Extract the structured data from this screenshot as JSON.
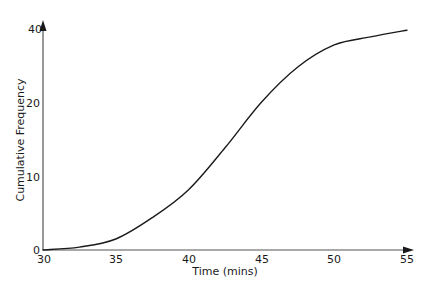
{
  "chart_data": {
    "type": "line",
    "title": "",
    "xlabel": "Time (mins)",
    "ylabel": "Cumulative Frequency",
    "x_ticks": [
      "30",
      "35",
      "40",
      "45",
      "50",
      "55"
    ],
    "y_ticks": [
      "0",
      "10",
      "20",
      "40"
    ],
    "xlim": [
      30,
      55
    ],
    "ylim": [
      0,
      40
    ],
    "grid": false,
    "legend": null,
    "series": [
      {
        "name": "Cumulative Frequency",
        "x": [
          30,
          32.5,
          35,
          37.5,
          40,
          42.5,
          45,
          47.5,
          50,
          52.5,
          55
        ],
        "values": [
          0,
          0.4,
          1.5,
          4.4,
          8.2,
          13.9,
          20.1,
          24.9,
          27.9,
          29.0,
          29.9
        ]
      }
    ]
  },
  "colors": {
    "axis": "#555555",
    "curve": "#1a1a1a",
    "text": "#1a1a1a"
  },
  "axes": {
    "x_title": "Time (mins)",
    "y_title": "Cumulative Frequency"
  }
}
